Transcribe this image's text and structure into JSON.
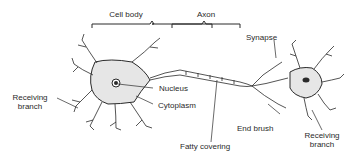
{
  "diagram": {
    "labels": {
      "cell_body": "Cell body",
      "axon": "Axon",
      "synapse": "Synapse",
      "receiving_branch_left_1": "Receiving",
      "receiving_branch_left_2": "branch",
      "nucleus": "Nucleus",
      "cytoplasm": "Cytoplasm",
      "end_brush": "End brush",
      "fatty_covering": "Fatty covering",
      "receiving_branch_right_1": "Receiving",
      "receiving_branch_right_2": "branch"
    },
    "colors": {
      "ink": "#2a2a2a",
      "background": "#ffffff",
      "stipple": "#bbbbbb"
    }
  }
}
